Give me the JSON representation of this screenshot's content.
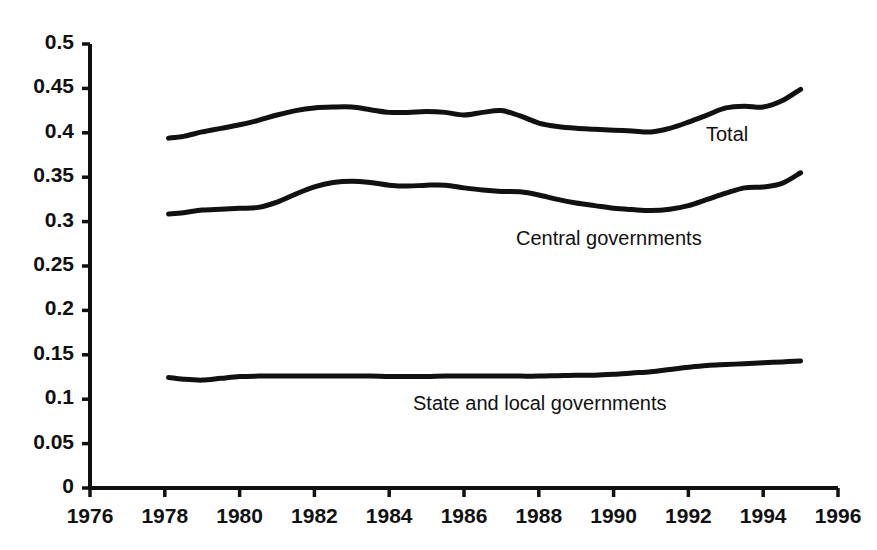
{
  "chart_data": {
    "type": "line",
    "title": "",
    "subtitle": "",
    "xlabel": "",
    "ylabel": "",
    "xlim": [
      1976,
      1996
    ],
    "ylim": [
      0,
      0.5
    ],
    "grid": false,
    "legend_position": "inline-right-of-series",
    "x_ticks": [
      "1976",
      "1978",
      "1980",
      "1982",
      "1984",
      "1986",
      "1988",
      "1990",
      "1992",
      "1994",
      "1996"
    ],
    "y_ticks": [
      "0",
      "0.05",
      "0.1",
      "0.15",
      "0.2",
      "0.25",
      "0.3",
      "0.35",
      "0.4",
      "0.45",
      "0.5"
    ],
    "line_color": "#111111",
    "x": [
      1978.1,
      1978.5,
      1979,
      1979.5,
      1980,
      1980.5,
      1981,
      1981.5,
      1982,
      1982.5,
      1983,
      1983.5,
      1984,
      1984.5,
      1985,
      1985.5,
      1986,
      1986.5,
      1987,
      1987.5,
      1988,
      1988.5,
      1989,
      1989.5,
      1990,
      1990.5,
      1991,
      1991.5,
      1992,
      1992.5,
      1993,
      1993.5,
      1994,
      1994.5,
      1995
    ],
    "series": [
      {
        "name": "Total",
        "values": [
          0.394,
          0.396,
          0.401,
          0.405,
          0.409,
          0.414,
          0.42,
          0.425,
          0.428,
          0.429,
          0.429,
          0.426,
          0.423,
          0.423,
          0.424,
          0.423,
          0.42,
          0.423,
          0.425,
          0.419,
          0.411,
          0.407,
          0.405,
          0.404,
          0.403,
          0.402,
          0.401,
          0.405,
          0.412,
          0.42,
          0.428,
          0.43,
          0.429,
          0.436,
          0.449
        ]
      },
      {
        "name": "Central governments",
        "values": [
          0.3085,
          0.31,
          0.313,
          0.314,
          0.315,
          0.316,
          0.322,
          0.331,
          0.339,
          0.344,
          0.3455,
          0.344,
          0.341,
          0.34,
          0.341,
          0.341,
          0.338,
          0.3355,
          0.334,
          0.3335,
          0.33,
          0.325,
          0.321,
          0.318,
          0.315,
          0.3135,
          0.3125,
          0.314,
          0.318,
          0.325,
          0.332,
          0.338,
          0.339,
          0.343,
          0.355
        ]
      },
      {
        "name": "State and local governments",
        "values": [
          0.1245,
          0.1225,
          0.1215,
          0.1235,
          0.1255,
          0.126,
          0.126,
          0.126,
          0.126,
          0.126,
          0.126,
          0.126,
          0.1255,
          0.1255,
          0.1255,
          0.126,
          0.126,
          0.126,
          0.126,
          0.126,
          0.126,
          0.1265,
          0.127,
          0.127,
          0.128,
          0.1295,
          0.131,
          0.1335,
          0.136,
          0.138,
          0.139,
          0.14,
          0.141,
          0.142,
          0.143
        ]
      }
    ]
  },
  "series_labels": {
    "total": "Total",
    "central": "Central governments",
    "state_local": "State and local governments"
  }
}
